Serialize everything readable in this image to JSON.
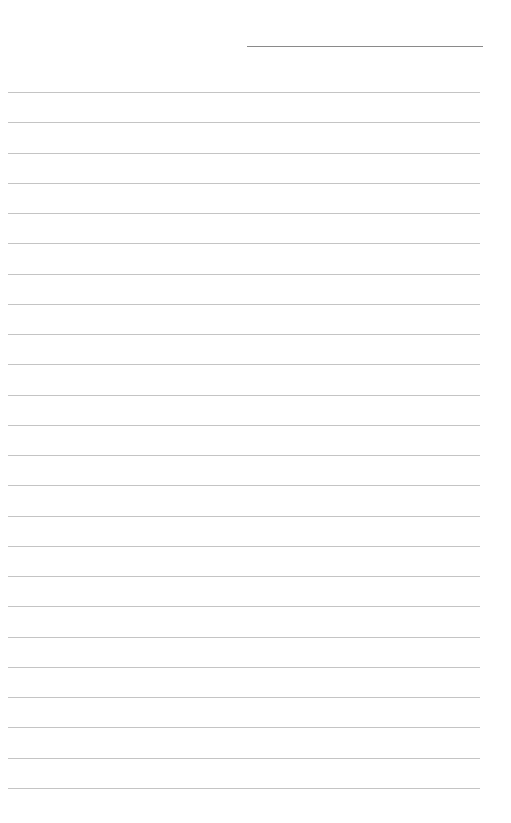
{
  "page": {
    "type": "lined-paper",
    "name_line": {
      "top": 46,
      "left": 247,
      "width": 236
    },
    "rules": {
      "count": 24,
      "first_top": 92,
      "spacing": 30.26,
      "left": 8,
      "width": 472
    },
    "colors": {
      "background": "#ffffff",
      "name_line": "#8a8a8a",
      "rule": "#c4c4c4"
    }
  }
}
